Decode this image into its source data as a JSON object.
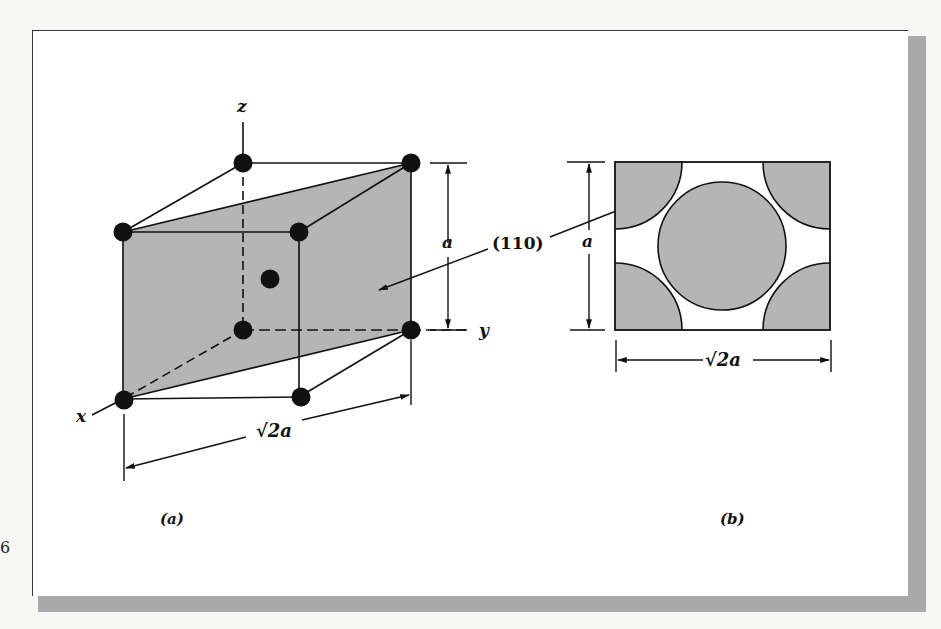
{
  "figure": {
    "panel_a": {
      "caption": "(a)",
      "axis_labels": {
        "z": "z",
        "y": "y",
        "x": "x"
      },
      "plane_label": "(110)",
      "height_dim": "a",
      "diag_dim": "√2a"
    },
    "panel_b": {
      "caption": "(b)",
      "height_dim": "a",
      "width_dim_prefix": "√",
      "width_dim": "2a"
    },
    "side_mark": "6"
  },
  "colors": {
    "shade": "#b5b5b5",
    "ink": "#111111",
    "shadow": "#a9a9a9",
    "paper": "#ffffff"
  }
}
